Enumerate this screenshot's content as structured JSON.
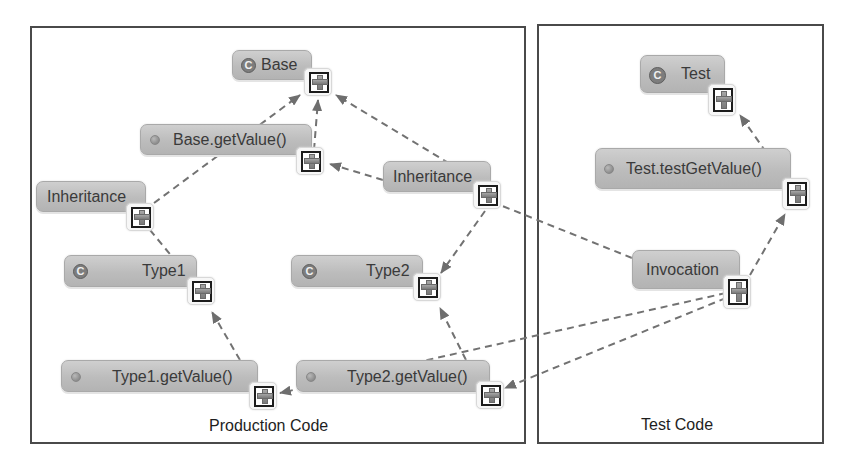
{
  "diagram": {
    "regions": [
      {
        "id": "production",
        "label": "Production Code"
      },
      {
        "id": "test",
        "label": "Test Code"
      }
    ],
    "nodes": {
      "base": {
        "label": "Base",
        "kind": "class",
        "icon": "class-icon",
        "icon_glyph": "C"
      },
      "base_get_value": {
        "label": "Base.getValue()",
        "kind": "method",
        "icon": "method-icon"
      },
      "inheritance_left": {
        "label": "Inheritance",
        "kind": "relation"
      },
      "inheritance_mid": {
        "label": "Inheritance",
        "kind": "relation"
      },
      "type1": {
        "label": "Type1",
        "kind": "class",
        "icon": "class-icon",
        "icon_glyph": "C"
      },
      "type2": {
        "label": "Type2",
        "kind": "class",
        "icon": "class-icon",
        "icon_glyph": "C"
      },
      "type1_get_value": {
        "label": "Type1.getValue()",
        "kind": "method",
        "icon": "method-icon"
      },
      "type2_get_value": {
        "label": "Type2.getValue()",
        "kind": "method",
        "icon": "method-icon"
      },
      "test": {
        "label": "Test",
        "kind": "class",
        "icon": "class-icon",
        "icon_glyph": "C"
      },
      "test_test_get_value": {
        "label": "Test.testGetValue()",
        "kind": "method",
        "icon": "method-icon"
      },
      "invocation": {
        "label": "Invocation",
        "kind": "relation"
      }
    },
    "expand_icon": "expand-plus-icon",
    "edges": [
      {
        "from": "base_get_value",
        "to": "base",
        "style": "dashed-arrow"
      },
      {
        "from": "inheritance_left",
        "to": "base",
        "style": "dashed-arrow"
      },
      {
        "from": "inheritance_left",
        "to": "type1",
        "style": "dashed-arrow"
      },
      {
        "from": "inheritance_mid",
        "to": "base",
        "style": "dashed-arrow"
      },
      {
        "from": "inheritance_mid",
        "to": "base_get_value",
        "style": "dashed-arrow"
      },
      {
        "from": "inheritance_mid",
        "to": "type2",
        "style": "dashed-arrow"
      },
      {
        "from": "type1_get_value",
        "to": "type1",
        "style": "dashed-arrow"
      },
      {
        "from": "type2_get_value",
        "to": "type2",
        "style": "dashed-arrow"
      },
      {
        "from": "test_test_get_value",
        "to": "test",
        "style": "dashed-arrow"
      },
      {
        "from": "invocation",
        "to": "test_test_get_value",
        "style": "dashed-arrow"
      },
      {
        "from": "invocation",
        "to": "type1_get_value",
        "style": "dashed-arrow"
      },
      {
        "from": "invocation",
        "to": "type2_get_value",
        "style": "dashed-arrow"
      },
      {
        "from": "invocation",
        "to": "inheritance_mid",
        "style": "dashed-line"
      }
    ],
    "colors": {
      "node_fill": "#bdbdbd",
      "edge": "#6e6e6e",
      "region_border": "#4a4a4a"
    }
  }
}
